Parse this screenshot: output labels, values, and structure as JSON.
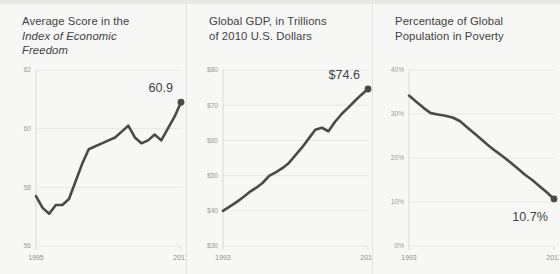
{
  "theme": {
    "background": "#f7f7f6",
    "line_color": "#4a4a4a",
    "grid_color": "#e6e6e4",
    "title_color": "#3f3f3f",
    "tick_color": "#9a9a99"
  },
  "panels": [
    {
      "title_line1": "Average Score in the",
      "title_line2": "Index of Economic",
      "title_line3": "Freedom",
      "end_label": "60.9"
    },
    {
      "title_line1": "Global GDP, in Trillions",
      "title_line2": "of 2010 U.S. Dollars",
      "title_line3": "",
      "end_label": "$74.6"
    },
    {
      "title_line1": "Percentage of Global",
      "title_line2": "Population in Poverty",
      "title_line3": "",
      "end_label": "10.7%"
    }
  ],
  "chart_data": [
    {
      "type": "line",
      "title": "Average Score in the Index of Economic Freedom",
      "xlabel": "",
      "ylabel": "",
      "xlim": [
        1995,
        2017
      ],
      "ylim": [
        56,
        62
      ],
      "yticks": [
        62,
        60,
        58,
        56
      ],
      "ytick_labels": [
        "62",
        "60",
        "58",
        "56"
      ],
      "xticks": [
        1995,
        2017
      ],
      "xtick_labels": [
        "1995",
        "2017"
      ],
      "grid": true,
      "legend": "none",
      "end_annotation": "60.9",
      "x": [
        1995,
        1996,
        1997,
        1998,
        1999,
        2000,
        2001,
        2002,
        2003,
        2004,
        2005,
        2006,
        2007,
        2008,
        2009,
        2010,
        2011,
        2012,
        2013,
        2014,
        2015,
        2016,
        2017
      ],
      "values": [
        57.7,
        57.3,
        57.1,
        57.4,
        57.4,
        57.6,
        58.2,
        58.8,
        59.3,
        59.4,
        59.5,
        59.6,
        59.7,
        59.9,
        60.1,
        59.7,
        59.5,
        59.6,
        59.8,
        59.6,
        60.0,
        60.4,
        60.9
      ]
    },
    {
      "type": "line",
      "title": "Global GDP, in Trillions of 2010 U.S. Dollars",
      "xlabel": "",
      "ylabel": "",
      "xlim": [
        1993,
        2015
      ],
      "ylim": [
        30,
        80
      ],
      "yticks": [
        80,
        70,
        60,
        50,
        40,
        30
      ],
      "ytick_labels": [
        "$80",
        "$70",
        "$60",
        "$50",
        "$40",
        "$30"
      ],
      "xticks": [
        1993,
        2015
      ],
      "xtick_labels": [
        "1993",
        "2015"
      ],
      "grid": true,
      "legend": "none",
      "end_annotation": "$74.6",
      "x": [
        1993,
        1994,
        1995,
        1996,
        1997,
        1998,
        1999,
        2000,
        2001,
        2002,
        2003,
        2004,
        2005,
        2006,
        2007,
        2008,
        2009,
        2010,
        2011,
        2012,
        2013,
        2014,
        2015
      ],
      "values": [
        40.0,
        41.2,
        42.4,
        43.8,
        45.3,
        46.5,
        47.9,
        49.9,
        50.9,
        52.1,
        53.6,
        55.8,
        58.0,
        60.5,
        63.0,
        63.6,
        62.6,
        65.3,
        67.5,
        69.3,
        71.2,
        73.0,
        74.6
      ]
    },
    {
      "type": "line",
      "title": "Percentage of Global Population in Poverty",
      "xlabel": "",
      "ylabel": "",
      "xlim": [
        1993,
        2013
      ],
      "ylim": [
        0,
        40
      ],
      "yticks": [
        40,
        30,
        20,
        10,
        0
      ],
      "ytick_labels": [
        "40%",
        "30%",
        "20%",
        "10%",
        "0%"
      ],
      "xticks": [
        1993,
        2013
      ],
      "xtick_labels": [
        "1993",
        "2013"
      ],
      "grid": true,
      "legend": "none",
      "end_annotation": "10.7%",
      "x": [
        1993,
        1994,
        1995,
        1996,
        1997,
        1998,
        1999,
        2000,
        2001,
        2002,
        2003,
        2004,
        2005,
        2006,
        2007,
        2008,
        2009,
        2010,
        2011,
        2012,
        2013
      ],
      "values": [
        34.2,
        32.8,
        31.4,
        30.2,
        29.9,
        29.6,
        29.2,
        28.4,
        27.0,
        25.6,
        24.2,
        22.8,
        21.5,
        20.3,
        19.0,
        17.6,
        16.2,
        15.0,
        13.6,
        12.2,
        10.7
      ]
    }
  ]
}
